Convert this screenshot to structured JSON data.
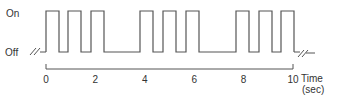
{
  "labels": {
    "on": "On",
    "off": "Off",
    "time": "Time",
    "unit": "(sec)"
  },
  "ticks": [
    "0",
    "2",
    "4",
    "6",
    "8",
    "10"
  ],
  "pulse_groups": [
    {
      "pulses": [
        [
          46,
          59
        ],
        [
          68,
          81
        ],
        [
          91,
          104
        ]
      ]
    },
    {
      "pulses": [
        [
          140,
          153
        ],
        [
          163,
          176
        ],
        [
          186,
          199
        ]
      ]
    },
    {
      "pulses": [
        [
          236,
          249
        ],
        [
          259,
          272
        ],
        [
          281,
          294
        ]
      ]
    }
  ],
  "colors": {
    "line": "#555555",
    "text": "#333333"
  }
}
